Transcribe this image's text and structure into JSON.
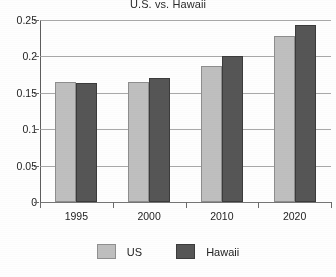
{
  "chart_data": {
    "type": "bar",
    "title": "U.S. vs. Hawaii",
    "xlabel": "",
    "ylabel": "",
    "categories": [
      "1995",
      "2000",
      "2010",
      "2020"
    ],
    "series": [
      {
        "name": "US",
        "color": "#bfbfbf",
        "values": [
          0.165,
          0.165,
          0.187,
          0.228
        ]
      },
      {
        "name": "Hawaii",
        "color": "#565656",
        "values": [
          0.164,
          0.17,
          0.201,
          0.243
        ]
      }
    ],
    "ylim": [
      0,
      0.25
    ],
    "ytick_values": [
      0,
      0.05,
      0.1,
      0.15,
      0.2,
      0.25
    ],
    "ytick_labels": [
      "0",
      "0.05",
      "0.1",
      "0.15",
      "0.2",
      "0.25"
    ],
    "grid": "horizontal",
    "legend_position": "bottom"
  },
  "legend": {
    "items": [
      {
        "label": "US"
      },
      {
        "label": "Hawaii"
      }
    ]
  }
}
